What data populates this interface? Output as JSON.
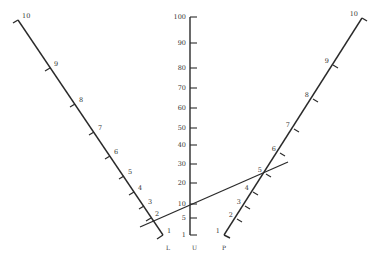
{
  "diagram": {
    "type": "nomogram",
    "scales": [
      {
        "id": "L",
        "name": "L",
        "position": "left",
        "ticks": [
          {
            "value": "10",
            "x": 18,
            "y": 20
          },
          {
            "value": "9",
            "x": 50,
            "y": 68
          },
          {
            "value": "8",
            "x": 75,
            "y": 104
          },
          {
            "value": "7",
            "x": 94,
            "y": 132
          },
          {
            "value": "6",
            "x": 110,
            "y": 156
          },
          {
            "value": "5",
            "x": 124,
            "y": 176
          },
          {
            "value": "4",
            "x": 134,
            "y": 192
          },
          {
            "value": "3",
            "x": 144,
            "y": 206
          },
          {
            "value": "2",
            "x": 151,
            "y": 218
          },
          {
            "value": "1",
            "x": 163,
            "y": 235
          }
        ]
      },
      {
        "id": "U",
        "name": "U",
        "position": "center",
        "ticks": [
          {
            "value": "100",
            "y": 17
          },
          {
            "value": "90",
            "y": 43
          },
          {
            "value": "80",
            "y": 68
          },
          {
            "value": "70",
            "y": 88
          },
          {
            "value": "60",
            "y": 108
          },
          {
            "value": "50",
            "y": 128
          },
          {
            "value": "40",
            "y": 145
          },
          {
            "value": "30",
            "y": 164
          },
          {
            "value": "20",
            "y": 183
          },
          {
            "value": "10",
            "y": 204
          },
          {
            "value": "5",
            "y": 218
          },
          {
            "value": "1",
            "y": 235
          }
        ]
      },
      {
        "id": "P",
        "name": "P",
        "position": "right",
        "ticks": [
          {
            "value": "10",
            "x": 362,
            "y": 18
          },
          {
            "value": "9",
            "x": 333,
            "y": 65
          },
          {
            "value": "8",
            "x": 313,
            "y": 99
          },
          {
            "value": "7",
            "x": 294,
            "y": 129
          },
          {
            "value": "6",
            "x": 280,
            "y": 153
          },
          {
            "value": "5",
            "x": 266,
            "y": 174
          },
          {
            "value": "4",
            "x": 253,
            "y": 192
          },
          {
            "value": "3",
            "x": 245,
            "y": 206
          },
          {
            "value": "2",
            "x": 237,
            "y": 219
          },
          {
            "value": "1",
            "x": 224,
            "y": 235
          }
        ]
      }
    ],
    "isopleth": {
      "from": {
        "x": 140,
        "y": 227
      },
      "to": {
        "x": 288,
        "y": 162
      },
      "passes_through": {
        "L": "2",
        "U": "10",
        "P": "5"
      }
    },
    "colors": {
      "ink": "#2a2a2a",
      "background": "#ffffff"
    }
  }
}
